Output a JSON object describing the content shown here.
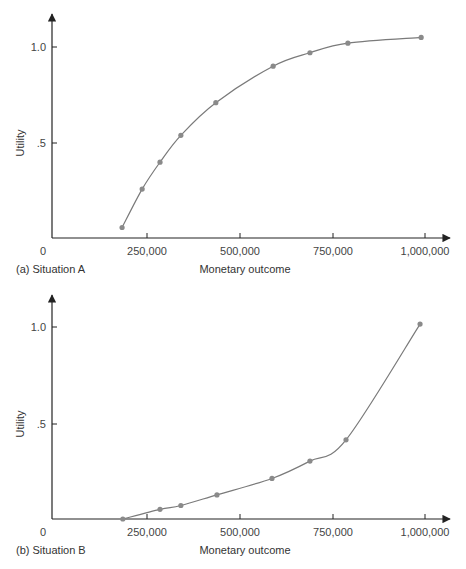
{
  "chart_data": [
    {
      "type": "line",
      "title": "(a) Situation A",
      "xlabel": "Monetary outcome",
      "ylabel": "Utility",
      "x_ticks": [
        "0",
        "250,000",
        "500,000",
        "750,000",
        "1,000,000"
      ],
      "y_ticks": [
        ".5",
        "1.0"
      ],
      "xlim": [
        0,
        1050000
      ],
      "ylim": [
        0,
        1.2
      ],
      "grid": false,
      "legend": null,
      "shape": "concave (risk-averse)",
      "x": [
        183000,
        237000,
        285000,
        341000,
        435000,
        589000,
        688000,
        790000,
        987000
      ],
      "y": [
        0.06,
        0.26,
        0.4,
        0.54,
        0.71,
        0.9,
        0.97,
        1.02,
        1.05
      ]
    },
    {
      "type": "line",
      "title": "(b) Situation B",
      "xlabel": "Monetary outcome",
      "ylabel": "Utility",
      "x_ticks": [
        "0",
        "250,000",
        "500,000",
        "750,000",
        "1,000,000"
      ],
      "y_ticks": [
        ".5",
        "1.0"
      ],
      "xlim": [
        0,
        1050000
      ],
      "ylim": [
        0,
        1.2
      ],
      "grid": false,
      "legend": null,
      "shape": "convex (risk-seeking)",
      "x": [
        185000,
        285000,
        341000,
        438000,
        586000,
        688000,
        785000,
        984000
      ],
      "y": [
        0.0,
        0.05,
        0.07,
        0.125,
        0.21,
        0.3,
        0.41,
        1.01
      ]
    }
  ],
  "charts": [
    {
      "caption": "(a) Situation A",
      "xlabel": "Monetary outcome",
      "ylabel": "Utility",
      "origin": "0",
      "x_ticks": [
        "250,000",
        "500,000",
        "750,000",
        "1,000,000"
      ],
      "y_ticks": [
        ".5",
        "1.0"
      ]
    },
    {
      "caption": "(b) Situation B",
      "xlabel": "Monetary outcome",
      "ylabel": "Utility",
      "origin": "0",
      "x_ticks": [
        "250,000",
        "500,000",
        "750,000",
        "1,000,000"
      ],
      "y_ticks": [
        ".5",
        "1.0"
      ]
    }
  ],
  "colors": {
    "axis": "#222222",
    "curve": "#7a7a7a",
    "marker": "#8a8a8a"
  }
}
